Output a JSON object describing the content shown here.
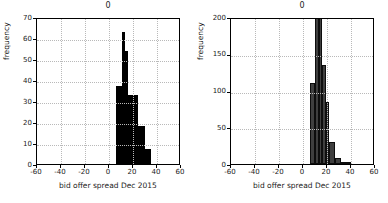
{
  "figure": {
    "panel_count": 2,
    "background": "#ffffff",
    "grid": true
  },
  "chart_data": [
    {
      "type": "bar",
      "title": "0",
      "xlabel": "bid offer spread Dec 2015",
      "ylabel": "frequency",
      "xlim": [
        -60,
        60
      ],
      "ylim": [
        0,
        70
      ],
      "xticks": [
        "-60",
        "-40",
        "-20",
        "0",
        "20",
        "40",
        "60"
      ],
      "xtick_values": [
        -60,
        -40,
        -20,
        0,
        20,
        40,
        60
      ],
      "yticks": [
        "0",
        "10",
        "20",
        "30",
        "40",
        "50",
        "60",
        "70"
      ],
      "ytick_values": [
        0,
        10,
        20,
        30,
        40,
        50,
        60,
        70
      ],
      "grid": true,
      "bar_color": "#000000",
      "bar_edge_color": "#000000",
      "bin_edges": [
        6,
        11,
        13.5,
        16,
        20,
        24,
        30,
        35
      ],
      "values": [
        37,
        63,
        54,
        33,
        33,
        18,
        7
      ],
      "bars": [
        {
          "x0": 6,
          "x1": 11,
          "height": 37
        },
        {
          "x0": 11,
          "x1": 13.5,
          "height": 63
        },
        {
          "x0": 13.5,
          "x1": 16,
          "height": 54
        },
        {
          "x0": 16,
          "x1": 20,
          "height": 33
        },
        {
          "x0": 20,
          "x1": 24,
          "height": 33
        },
        {
          "x0": 24,
          "x1": 30,
          "height": 18
        },
        {
          "x0": 30,
          "x1": 35,
          "height": 7
        }
      ]
    },
    {
      "type": "bar",
      "title": "0",
      "xlabel": "bid offer spread Dec 2015",
      "ylabel": "frequency",
      "xlim": [
        -60,
        60
      ],
      "ylim": [
        0,
        200
      ],
      "xticks": [
        "-60",
        "-40",
        "-20",
        "0",
        "20",
        "40",
        "60"
      ],
      "xtick_values": [
        -60,
        -40,
        -20,
        0,
        20,
        40,
        60
      ],
      "yticks": [
        "0",
        "50",
        "100",
        "150",
        "200"
      ],
      "ytick_values": [
        0,
        50,
        100,
        150,
        200
      ],
      "grid": true,
      "bar_color": "#3f3f3f",
      "bar_edge_color": "#0d0d0d",
      "bin_edges": [
        6,
        10,
        13,
        16,
        19,
        22,
        27,
        32,
        37,
        40
      ],
      "values": [
        110,
        198,
        200,
        135,
        85,
        30,
        8,
        3,
        2
      ],
      "bars": [
        {
          "x0": 6,
          "x1": 10,
          "height": 110
        },
        {
          "x0": 10,
          "x1": 13,
          "height": 198
        },
        {
          "x0": 13,
          "x1": 16,
          "height": 200
        },
        {
          "x0": 16,
          "x1": 19,
          "height": 135
        },
        {
          "x0": 19,
          "x1": 22,
          "height": 85
        },
        {
          "x0": 22,
          "x1": 27,
          "height": 30
        },
        {
          "x0": 27,
          "x1": 32,
          "height": 8
        },
        {
          "x0": 32,
          "x1": 37,
          "height": 3
        },
        {
          "x0": 37,
          "x1": 40,
          "height": 2
        }
      ]
    }
  ]
}
